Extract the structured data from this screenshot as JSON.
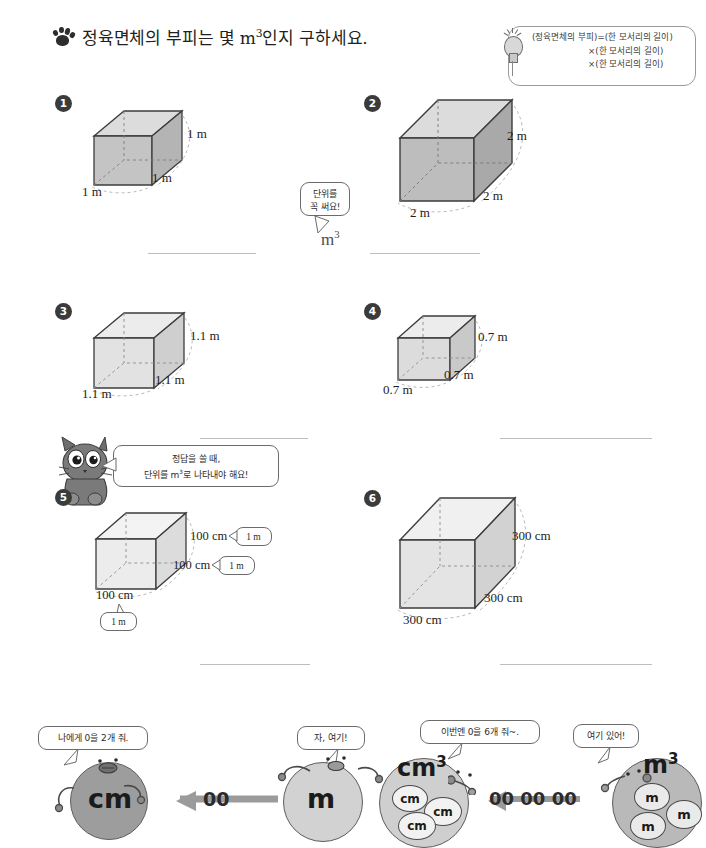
{
  "header": {
    "paw_icon": "paw-print-icon",
    "instruction_pre": "정육면체의 부피는 몇 ",
    "instruction_unit": "m",
    "instruction_sup": "3",
    "instruction_post": "인지 구하세요."
  },
  "hint": {
    "bulb_icon": "lightbulb-icon",
    "line1": "(정육면체의 부피)=(한 모서리의 길이)",
    "line2": "×(한 모서리의 길이)",
    "line3": "×(한 모서리의 길이)"
  },
  "tips": {
    "unit_bubble_line1": "단위를",
    "unit_bubble_line2": "꼭 써요!",
    "unit_answer": "m",
    "unit_answer_sup": "3",
    "cat_icon": "cat-character-icon",
    "cat_bubble_line1": "정답을 쓸 때,",
    "cat_bubble_line2_a": "단위를 m",
    "cat_bubble_line2_sup": "3",
    "cat_bubble_line2_b": "로 나타내야 해요!"
  },
  "problems": [
    {
      "number": "1",
      "edge_height": "1 m",
      "edge_depth": "1 m",
      "edge_width": "1 m"
    },
    {
      "number": "2",
      "edge_height": "2 m",
      "edge_depth": "2 m",
      "edge_width": "2 m"
    },
    {
      "number": "3",
      "edge_height": "1.1 m",
      "edge_depth": "1.1 m",
      "edge_width": "1.1 m"
    },
    {
      "number": "4",
      "edge_height": "0.7 m",
      "edge_depth": "0.7 m",
      "edge_width": "0.7 m"
    },
    {
      "number": "5",
      "edge_height": "100 cm",
      "edge_depth": "100 cm",
      "edge_width": "100 cm",
      "callout_height": "1 m",
      "callout_depth": "1 m",
      "callout_width": "1 m"
    },
    {
      "number": "6",
      "edge_height": "300 cm",
      "edge_depth": "300 cm",
      "edge_width": "300 cm"
    }
  ],
  "cartoon": {
    "left": {
      "receiver_bubble": "나에게 0을 2개 줘.",
      "receiver_label": "cm",
      "giver_bubble": "자, 여기!",
      "giver_label": "m",
      "transfer_zeros": "00"
    },
    "right": {
      "receiver_bubble": "이번엔 0을 6개 줘~.",
      "receiver_label": "cm",
      "receiver_sup": "3",
      "receiver_minis": [
        "cm",
        "cm",
        "cm"
      ],
      "giver_bubble": "여기 있어!",
      "giver_label": "m",
      "giver_sup": "3",
      "giver_minis": [
        "m",
        "m",
        "m"
      ],
      "transfer_zeros": "00 00 00"
    }
  },
  "colors": {
    "cube_top": "#dcdcdc",
    "cube_front": "#b4b4b4",
    "cube_side": "#c2c2c2",
    "cube_light_top": "#ececec",
    "cube_light_front": "#dcdcdc",
    "outline": "#3d3d3d",
    "rule": "#bdbdbd",
    "badge": "#3b3b3b",
    "blob_dark": "#9d9d9d",
    "blob_light": "#d2d2d2",
    "arrow": "#9b9b9b"
  }
}
